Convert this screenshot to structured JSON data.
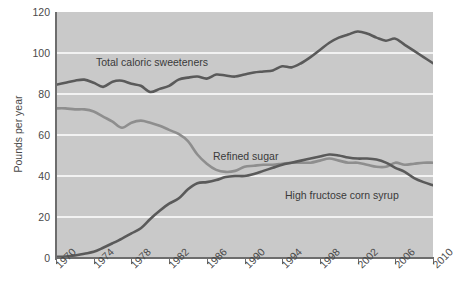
{
  "chart_data": {
    "type": "line",
    "title": "",
    "subtitle": "",
    "xlabel": "",
    "ylabel": "Pounds per year",
    "xlim": [
      1970,
      2010
    ],
    "ylim": [
      0,
      120
    ],
    "grid": true,
    "gridlines_y": [
      20,
      40,
      60,
      80,
      100
    ],
    "legend_position": "inline-annotations",
    "background_color": "#c9c9c9",
    "gridline_color": "#ffffff",
    "axis_color": "#6d6d6d",
    "ytick_labels": [
      "0",
      "20",
      "40",
      "60",
      "80",
      "100",
      "120"
    ],
    "ytick_values": [
      0,
      20,
      40,
      60,
      80,
      100,
      120
    ],
    "xtick_labels": [
      "1970",
      "1974",
      "1978",
      "1982",
      "1986",
      "1990",
      "1994",
      "1998",
      "2002",
      "2006",
      "2010"
    ],
    "xtick_values": [
      1970,
      1974,
      1978,
      1982,
      1986,
      1990,
      1994,
      1998,
      2002,
      2006,
      2010
    ],
    "x": [
      1970,
      1971,
      1972,
      1973,
      1974,
      1975,
      1976,
      1977,
      1978,
      1979,
      1980,
      1981,
      1982,
      1983,
      1984,
      1985,
      1986,
      1987,
      1988,
      1989,
      1990,
      1991,
      1992,
      1993,
      1994,
      1995,
      1996,
      1997,
      1998,
      1999,
      2000,
      2001,
      2002,
      2003,
      2004,
      2005,
      2006,
      2007,
      2008,
      2009,
      2010
    ],
    "series": [
      {
        "name": "Total caloric sweeteners",
        "color": "#5a5a5a",
        "width": 2.6,
        "label_text": "Total caloric sweeteners",
        "values": [
          84.5,
          85.5,
          86.5,
          87.0,
          85.5,
          83.5,
          86.0,
          86.5,
          85.0,
          84.0,
          81.0,
          82.5,
          84.0,
          87.0,
          88.0,
          88.5,
          87.5,
          89.5,
          89.0,
          88.5,
          89.5,
          90.5,
          91.0,
          91.5,
          93.5,
          93.0,
          95.0,
          98.0,
          101.5,
          105.0,
          107.5,
          109.0,
          110.5,
          109.5,
          107.5,
          106.0,
          107.0,
          104.0,
          101.0,
          98.0,
          95.0
        ]
      },
      {
        "name": "Refined sugar",
        "color": "#8e8e8e",
        "width": 2.6,
        "label_text": "Refined sugar",
        "values": [
          73.0,
          73.0,
          72.5,
          72.5,
          71.5,
          69.0,
          66.5,
          63.5,
          66.0,
          67.0,
          66.0,
          64.5,
          62.5,
          60.5,
          57.0,
          50.5,
          46.0,
          43.0,
          42.0,
          42.5,
          44.5,
          45.0,
          45.5,
          45.5,
          46.0,
          46.5,
          46.5,
          46.5,
          47.5,
          48.5,
          47.5,
          46.5,
          46.5,
          45.5,
          44.5,
          44.5,
          46.5,
          45.5,
          46.0,
          46.5,
          46.5
        ]
      },
      {
        "name": "High fructose corn syrup",
        "color": "#5a5a5a",
        "width": 2.6,
        "label_text": "High fructose corn syrup",
        "values": [
          0.5,
          0.7,
          1.2,
          2.1,
          3.0,
          5.0,
          7.2,
          9.5,
          12.0,
          14.5,
          19.0,
          23.0,
          26.5,
          29.0,
          33.5,
          36.5,
          37.0,
          38.0,
          39.5,
          40.0,
          40.0,
          41.0,
          42.5,
          44.0,
          45.5,
          46.5,
          47.5,
          48.5,
          49.5,
          50.5,
          50.0,
          49.0,
          48.5,
          48.5,
          48.0,
          46.5,
          44.0,
          42.0,
          39.0,
          37.0,
          35.5
        ]
      }
    ]
  }
}
